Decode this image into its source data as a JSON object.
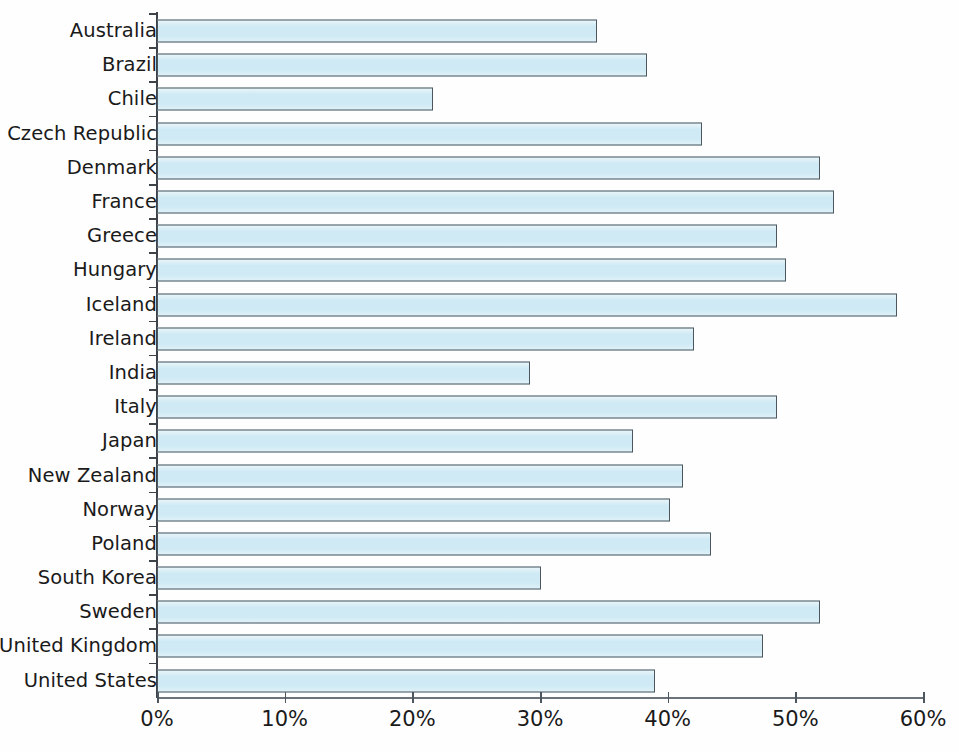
{
  "chart_data": {
    "type": "bar",
    "orientation": "horizontal",
    "title": "",
    "subtitle": "",
    "xlabel": "",
    "ylabel": "",
    "xlim": [
      0,
      60
    ],
    "grid": false,
    "legend": null,
    "axis_unit": "%",
    "tick_labels": [
      "0%",
      "10%",
      "20%",
      "30%",
      "40%",
      "50%",
      "60%"
    ],
    "tick_values": [
      0,
      10,
      20,
      30,
      40,
      50,
      60
    ],
    "categories": [
      "Australia",
      "Brazil",
      "Chile",
      "Czech Republic",
      "Denmark",
      "France",
      "Greece",
      "Hungary",
      "Iceland",
      "Ireland",
      "India",
      "Italy",
      "Japan",
      "New Zealand",
      "Norway",
      "Poland",
      "South Korea",
      "Sweden",
      "United Kingdom",
      "United States"
    ],
    "values": [
      34.5,
      38.4,
      21.6,
      42.7,
      51.9,
      53.0,
      48.6,
      49.3,
      58.0,
      42.1,
      29.2,
      48.6,
      37.3,
      41.2,
      40.2,
      43.4,
      30.1,
      51.9,
      47.5,
      39.0
    ],
    "bars": [
      {
        "label": "Australia",
        "value": 34.5
      },
      {
        "label": "Brazil",
        "value": 38.4
      },
      {
        "label": "Chile",
        "value": 21.6
      },
      {
        "label": "Czech Republic",
        "value": 42.7
      },
      {
        "label": "Denmark",
        "value": 51.9
      },
      {
        "label": "France",
        "value": 53.0
      },
      {
        "label": "Greece",
        "value": 48.6
      },
      {
        "label": "Hungary",
        "value": 49.3
      },
      {
        "label": "Iceland",
        "value": 58.0
      },
      {
        "label": "Ireland",
        "value": 42.1
      },
      {
        "label": "India",
        "value": 29.2
      },
      {
        "label": "Italy",
        "value": 48.6
      },
      {
        "label": "Japan",
        "value": 37.3
      },
      {
        "label": "New Zealand",
        "value": 41.2
      },
      {
        "label": "Norway",
        "value": 40.2
      },
      {
        "label": "Poland",
        "value": 43.4
      },
      {
        "label": "South Korea",
        "value": 30.1
      },
      {
        "label": "Sweden",
        "value": 51.9
      },
      {
        "label": "United Kingdom",
        "value": 47.5
      },
      {
        "label": "United States",
        "value": 39.0
      }
    ],
    "colors": {
      "bar_fill": "#cfeaf4",
      "bar_stroke": "#4c565e",
      "axis": "#3d4348",
      "text": "#1a1a1a",
      "background": "#ffffff"
    }
  },
  "caption": {
    "text": ""
  }
}
